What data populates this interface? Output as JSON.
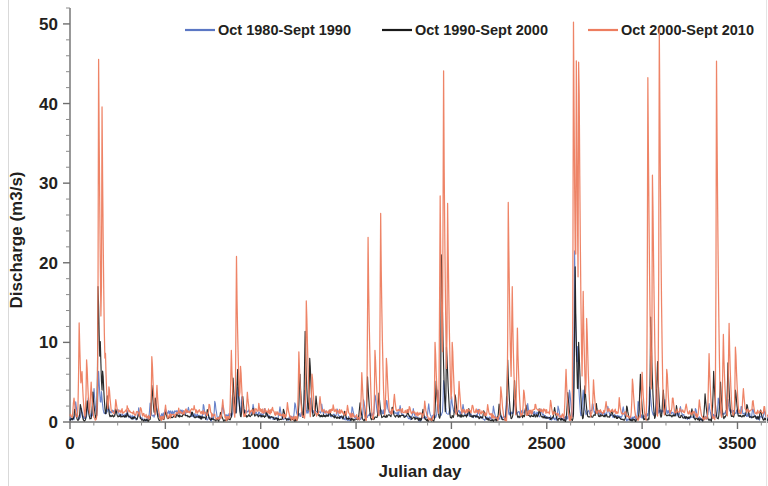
{
  "chart_data": {
    "type": "line",
    "title": "",
    "xlabel": "Julian day",
    "ylabel": "Discharge (m3/s)",
    "xlim": [
      0,
      3660
    ],
    "ylim": [
      0,
      52
    ],
    "xticks": [
      0,
      500,
      1000,
      1500,
      2000,
      2500,
      3000,
      3500
    ],
    "yticks": [
      0,
      10,
      20,
      30,
      40,
      50
    ],
    "xtick_labels": [
      "0",
      "500",
      "1000",
      "1500",
      "2000",
      "2500",
      "3000",
      "3500"
    ],
    "ytick_labels": [
      "0",
      "10",
      "20",
      "30",
      "40",
      "50"
    ],
    "minor_tick_step_y": 2,
    "minor_tick_step_x": 125,
    "grid": false,
    "legend_position": "top",
    "series": [
      {
        "name": "Oct 1980-Sept 1990",
        "color": "#5B77C4",
        "baseline": 0.8,
        "peaks": [
          [
            30,
            2.4
          ],
          [
            60,
            1.6
          ],
          [
            95,
            3.0
          ],
          [
            125,
            4.2
          ],
          [
            150,
            6.0
          ],
          [
            165,
            3.4
          ],
          [
            200,
            2.0
          ],
          [
            250,
            1.4
          ],
          [
            300,
            1.1
          ],
          [
            360,
            1.6
          ],
          [
            420,
            2.2
          ],
          [
            450,
            2.6
          ],
          [
            500,
            1.5
          ],
          [
            560,
            1.2
          ],
          [
            620,
            1.6
          ],
          [
            700,
            2.2
          ],
          [
            760,
            2.6
          ],
          [
            800,
            2.1
          ],
          [
            860,
            3.0
          ],
          [
            880,
            4.4
          ],
          [
            900,
            2.8
          ],
          [
            960,
            1.8
          ],
          [
            1020,
            1.5
          ],
          [
            1100,
            1.9
          ],
          [
            1180,
            2.4
          ],
          [
            1230,
            3.6
          ],
          [
            1260,
            2.6
          ],
          [
            1320,
            1.8
          ],
          [
            1400,
            1.5
          ],
          [
            1480,
            1.9
          ],
          [
            1540,
            2.8
          ],
          [
            1600,
            3.4
          ],
          [
            1660,
            2.6
          ],
          [
            1730,
            1.9
          ],
          [
            1800,
            1.6
          ],
          [
            1880,
            2.2
          ],
          [
            1930,
            4.0
          ],
          [
            1960,
            5.2
          ],
          [
            2000,
            3.0
          ],
          [
            2060,
            2.0
          ],
          [
            2140,
            1.6
          ],
          [
            2220,
            1.9
          ],
          [
            2290,
            3.2
          ],
          [
            2330,
            2.6
          ],
          [
            2400,
            1.8
          ],
          [
            2470,
            1.5
          ],
          [
            2560,
            2.0
          ],
          [
            2620,
            4.0
          ],
          [
            2645,
            21.5
          ],
          [
            2660,
            9.0
          ],
          [
            2690,
            4.0
          ],
          [
            2740,
            2.2
          ],
          [
            2820,
            1.7
          ],
          [
            2900,
            1.9
          ],
          [
            2980,
            2.6
          ],
          [
            3040,
            4.4
          ],
          [
            3075,
            3.6
          ],
          [
            3120,
            2.4
          ],
          [
            3200,
            1.8
          ],
          [
            3280,
            1.7
          ],
          [
            3350,
            2.2
          ],
          [
            3400,
            3.0
          ],
          [
            3450,
            2.4
          ],
          [
            3520,
            1.9
          ],
          [
            3580,
            1.6
          ],
          [
            3640,
            1.4
          ]
        ]
      },
      {
        "name": "Oct 1990-Sept 2000",
        "color": "#1A1A1A",
        "baseline": 0.5,
        "peaks": [
          [
            25,
            1.6
          ],
          [
            55,
            2.2
          ],
          [
            90,
            2.6
          ],
          [
            120,
            3.6
          ],
          [
            148,
            17.0
          ],
          [
            158,
            9.0
          ],
          [
            172,
            6.4
          ],
          [
            195,
            3.0
          ],
          [
            240,
            1.4
          ],
          [
            300,
            0.9
          ],
          [
            360,
            1.0
          ],
          [
            430,
            4.6
          ],
          [
            448,
            3.0
          ],
          [
            500,
            1.2
          ],
          [
            560,
            0.9
          ],
          [
            640,
            1.1
          ],
          [
            720,
            1.4
          ],
          [
            790,
            1.2
          ],
          [
            855,
            5.4
          ],
          [
            878,
            6.6
          ],
          [
            905,
            3.2
          ],
          [
            960,
            1.4
          ],
          [
            1030,
            1.2
          ],
          [
            1120,
            1.6
          ],
          [
            1205,
            6.0
          ],
          [
            1232,
            11.4
          ],
          [
            1258,
            8.0
          ],
          [
            1290,
            3.0
          ],
          [
            1360,
            1.4
          ],
          [
            1440,
            1.2
          ],
          [
            1520,
            2.4
          ],
          [
            1560,
            5.6
          ],
          [
            1620,
            3.4
          ],
          [
            1690,
            1.8
          ],
          [
            1770,
            1.3
          ],
          [
            1850,
            1.6
          ],
          [
            1920,
            5.0
          ],
          [
            1948,
            21.0
          ],
          [
            1975,
            9.4
          ],
          [
            2020,
            3.4
          ],
          [
            2090,
            1.6
          ],
          [
            2170,
            1.4
          ],
          [
            2250,
            2.2
          ],
          [
            2295,
            7.6
          ],
          [
            2330,
            5.2
          ],
          [
            2390,
            2.0
          ],
          [
            2460,
            1.4
          ],
          [
            2540,
            1.8
          ],
          [
            2610,
            3.6
          ],
          [
            2648,
            19.5
          ],
          [
            2668,
            10.0
          ],
          [
            2700,
            4.4
          ],
          [
            2760,
            2.0
          ],
          [
            2840,
            1.4
          ],
          [
            2920,
            2.0
          ],
          [
            2990,
            6.0
          ],
          [
            3045,
            13.0
          ],
          [
            3080,
            7.6
          ],
          [
            3110,
            4.0
          ],
          [
            3180,
            1.8
          ],
          [
            3260,
            1.6
          ],
          [
            3330,
            3.4
          ],
          [
            3375,
            6.2
          ],
          [
            3410,
            5.0
          ],
          [
            3450,
            7.2
          ],
          [
            3490,
            4.0
          ],
          [
            3550,
            2.2
          ],
          [
            3620,
            1.5
          ]
        ]
      },
      {
        "name": "Oct 2000-Sept 2010",
        "color": "#ED7D5F",
        "baseline": 0.9,
        "peaks": [
          [
            20,
            3.0
          ],
          [
            48,
            12.2
          ],
          [
            62,
            6.2
          ],
          [
            88,
            7.8
          ],
          [
            110,
            5.0
          ],
          [
            150,
            45.3
          ],
          [
            168,
            38.0
          ],
          [
            185,
            8.0
          ],
          [
            205,
            4.4
          ],
          [
            240,
            2.4
          ],
          [
            300,
            1.5
          ],
          [
            370,
            1.8
          ],
          [
            430,
            8.2
          ],
          [
            455,
            4.6
          ],
          [
            500,
            2.0
          ],
          [
            570,
            1.4
          ],
          [
            650,
            1.6
          ],
          [
            730,
            2.2
          ],
          [
            800,
            2.8
          ],
          [
            845,
            9.0
          ],
          [
            872,
            20.8
          ],
          [
            895,
            7.0
          ],
          [
            930,
            3.4
          ],
          [
            990,
            1.8
          ],
          [
            1060,
            1.6
          ],
          [
            1140,
            2.2
          ],
          [
            1200,
            8.6
          ],
          [
            1240,
            15.2
          ],
          [
            1270,
            6.0
          ],
          [
            1310,
            3.0
          ],
          [
            1380,
            1.6
          ],
          [
            1455,
            1.8
          ],
          [
            1530,
            6.0
          ],
          [
            1562,
            23.2
          ],
          [
            1600,
            9.0
          ],
          [
            1628,
            26.2
          ],
          [
            1660,
            8.0
          ],
          [
            1700,
            3.4
          ],
          [
            1780,
            1.8
          ],
          [
            1860,
            2.4
          ],
          [
            1915,
            10.0
          ],
          [
            1940,
            28.4
          ],
          [
            1958,
            44.1
          ],
          [
            1980,
            27.0
          ],
          [
            2005,
            10.0
          ],
          [
            2040,
            4.6
          ],
          [
            2110,
            2.0
          ],
          [
            2190,
            1.8
          ],
          [
            2260,
            4.4
          ],
          [
            2298,
            27.4
          ],
          [
            2318,
            17.0
          ],
          [
            2345,
            11.8
          ],
          [
            2380,
            4.0
          ],
          [
            2440,
            2.0
          ],
          [
            2520,
            2.4
          ],
          [
            2600,
            6.6
          ],
          [
            2640,
            50.1
          ],
          [
            2655,
            42.2
          ],
          [
            2668,
            45.2
          ],
          [
            2690,
            16.4
          ],
          [
            2710,
            13.0
          ],
          [
            2745,
            5.0
          ],
          [
            2810,
            2.2
          ],
          [
            2880,
            2.6
          ],
          [
            2950,
            5.4
          ],
          [
            3000,
            6.0
          ],
          [
            3030,
            43.0
          ],
          [
            3055,
            31.0
          ],
          [
            3090,
            49.2
          ],
          [
            3130,
            6.6
          ],
          [
            3160,
            3.0
          ],
          [
            3230,
            2.0
          ],
          [
            3300,
            2.6
          ],
          [
            3350,
            8.6
          ],
          [
            3390,
            45.2
          ],
          [
            3425,
            11.0
          ],
          [
            3455,
            12.4
          ],
          [
            3490,
            9.4
          ],
          [
            3530,
            4.0
          ],
          [
            3580,
            2.6
          ],
          [
            3640,
            1.8
          ]
        ]
      }
    ]
  },
  "legend": {
    "items": [
      {
        "label": "Oct 1980-Sept 1990",
        "color": "#5B77C4"
      },
      {
        "label": "Oct 1990-Sept 2000",
        "color": "#1A1A1A"
      },
      {
        "label": "Oct 2000-Sept 2010",
        "color": "#ED7D5F"
      }
    ]
  },
  "axes": {
    "y_title": "Discharge (m3/s)",
    "x_title": "Julian day"
  }
}
